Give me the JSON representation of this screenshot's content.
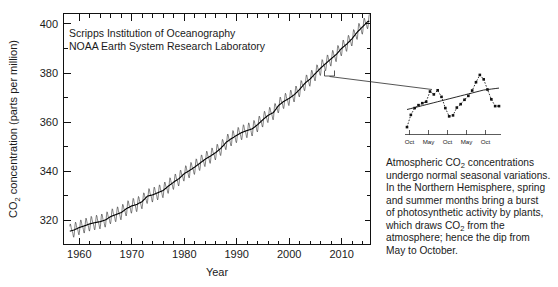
{
  "figure": {
    "credits": [
      "Scripps Institution of Oceanography",
      "NOAA Earth System Research Laboratory"
    ]
  },
  "caption": {
    "lines": [
      "Atmospheric CO2 concentrations",
      "undergo normal seasonal variations.",
      "In the Northern Hemisphere, spring",
      "and summer months bring a burst",
      "of photosynthetic activity by plants,",
      "which draws CO2 from the",
      "atmosphere; hence the dip from",
      "May to October."
    ],
    "full_text": "Atmospheric CO2 concentrations undergo normal seasonal variations. In the Northern Hemisphere, spring and summer months bring a burst of photosynthetic activity by plants, which draws CO2 from the atmosphere; hence the dip from May to October."
  },
  "chart_data": [
    {
      "id": "main",
      "type": "line",
      "title": "",
      "xlabel": "Year",
      "ylabel": "CO2 concentration (parts per million)",
      "ylabel_parts": {
        "pre": "CO",
        "sub": "2",
        "post": " concentration (parts per million)"
      },
      "xlim": [
        1957.0,
        2015.5
      ],
      "ylim": [
        310.0,
        404.0
      ],
      "xticks": [
        1960,
        1970,
        1980,
        1990,
        2000,
        2010
      ],
      "xtick_labels": [
        "1960",
        "1970",
        "1980",
        "1990",
        "2000",
        "2010"
      ],
      "xminor_step": 2,
      "yticks": [
        320,
        340,
        360,
        380,
        400
      ],
      "ytick_labels": [
        "320",
        "340",
        "360",
        "380",
        "400"
      ],
      "yminor_step": 10,
      "grid": false,
      "legend": "none",
      "series": [
        {
          "name": "Monthly mean CO2 (Mauna Loa)",
          "style": "sawtooth-monthly",
          "x": [
            1958,
            1959,
            1960,
            1961,
            1962,
            1963,
            1964,
            1965,
            1966,
            1967,
            1968,
            1969,
            1970,
            1971,
            1972,
            1973,
            1974,
            1975,
            1976,
            1977,
            1978,
            1979,
            1980,
            1981,
            1982,
            1983,
            1984,
            1985,
            1986,
            1987,
            1988,
            1989,
            1990,
            1991,
            1992,
            1993,
            1994,
            1995,
            1996,
            1997,
            1998,
            1999,
            2000,
            2001,
            2002,
            2003,
            2004,
            2005,
            2006,
            2007,
            2008,
            2009,
            2010,
            2011,
            2012,
            2013,
            2014,
            2015
          ],
          "values": [
            315.3,
            315.9,
            316.9,
            317.6,
            318.4,
            318.9,
            319.3,
            320.0,
            321.4,
            322.2,
            323.0,
            324.6,
            325.7,
            326.3,
            327.5,
            329.7,
            330.2,
            331.1,
            332.0,
            333.8,
            335.4,
            336.8,
            338.8,
            340.1,
            341.5,
            343.1,
            344.7,
            346.0,
            347.4,
            349.2,
            351.6,
            353.1,
            354.4,
            355.6,
            356.4,
            357.1,
            358.8,
            360.8,
            362.6,
            363.7,
            366.6,
            368.3,
            369.5,
            371.0,
            373.1,
            375.6,
            377.4,
            379.6,
            381.8,
            383.7,
            385.6,
            387.4,
            389.8,
            391.6,
            393.8,
            396.5,
            398.6,
            400.8
          ],
          "seasonal_amplitude": 3.0
        },
        {
          "name": "Seasonally adjusted trend",
          "style": "smooth-trend"
        }
      ]
    },
    {
      "id": "inset",
      "type": "line",
      "title": "",
      "xlabel": "",
      "ylabel": "",
      "xtick_labels": [
        "Oct",
        "May",
        "Oct",
        "May",
        "Oct"
      ],
      "xticks_count": 6,
      "grid": false,
      "legend": "none",
      "series": [
        {
          "name": "Monthly mean CO2",
          "style": "dotted-with-square-markers",
          "values": [
            358.8,
            363.8,
            366.6,
            367.8,
            368.6,
            369.2,
            373.4,
            372.2,
            373.9,
            371.2,
            366.6,
            363.2,
            363.6,
            366.8,
            368.2,
            370.0,
            371.6,
            373.8,
            377.2,
            380.2,
            378.4,
            374.2,
            370.2,
            367.4,
            367.4
          ]
        },
        {
          "name": "Seasonally adjusted trend",
          "style": "smooth-trend",
          "values": [
            366.0,
            366.4,
            366.8,
            367.2,
            367.6,
            368.0,
            368.4,
            368.8,
            369.2,
            369.6,
            370.0,
            370.4,
            370.8,
            371.2,
            371.6,
            372.0,
            372.4,
            372.8,
            373.2,
            373.6,
            374.0,
            374.2,
            374.4,
            374.6,
            374.8
          ]
        }
      ]
    }
  ]
}
